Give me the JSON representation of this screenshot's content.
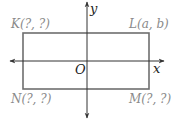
{
  "diagram": {
    "axes": {
      "x_label": "x",
      "y_label": "y",
      "origin_label": "O"
    },
    "rectangle": {
      "vertices": [
        {
          "name": "K",
          "label": "K(?, ?)",
          "position": "top-left"
        },
        {
          "name": "L",
          "label": "L(a, b)",
          "position": "top-right"
        },
        {
          "name": "M",
          "label": "M(?, ?)",
          "position": "bottom-right"
        },
        {
          "name": "N",
          "label": "N(?, ?)",
          "position": "bottom-left"
        }
      ],
      "stroke_color": "#6e6e6e"
    },
    "axis_color": "#333333"
  }
}
